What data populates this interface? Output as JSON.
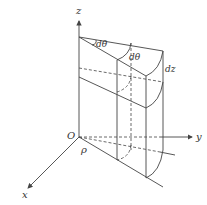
{
  "diagram": {
    "axes": {
      "z_label": "z",
      "y_label": "y",
      "x_label": "x",
      "origin_label": "O"
    },
    "labels": {
      "angle1": "dθ",
      "angle2": "dθ",
      "height": "dz",
      "radius": "ρ"
    },
    "colors": {
      "line": "#444444",
      "background": "#ffffff"
    }
  }
}
